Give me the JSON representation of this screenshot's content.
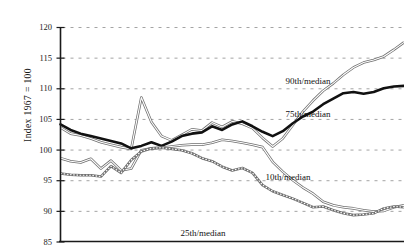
{
  "chart_data": {
    "type": "line",
    "title": "",
    "subtitle": "",
    "xlabel": "",
    "ylabel": "Index 1967 = 100",
    "ylim": [
      85,
      120
    ],
    "xlim": [
      0,
      34
    ],
    "yticks": [
      85,
      90,
      95,
      100,
      105,
      110,
      115,
      120
    ],
    "ytick_labels": [
      "85",
      "90",
      "95",
      "100",
      "105",
      "110",
      "115",
      "120"
    ],
    "xticks": [],
    "xtick_labels": [],
    "grid": "horizontal-dashed",
    "legend_position": "inline-annotations",
    "series": [
      {
        "name": "90th/median",
        "style": "double-thin-gray",
        "label_x": 308,
        "label_y": 77,
        "x": [
          0,
          1,
          2,
          3,
          4,
          5,
          6,
          7,
          8,
          9,
          10,
          11,
          12,
          13,
          14,
          15,
          16,
          17,
          18,
          19,
          20,
          21,
          22,
          23,
          24,
          25,
          26,
          27,
          28,
          29,
          30,
          31,
          32,
          33,
          34
        ],
        "values": [
          103.6,
          102.6,
          102.3,
          101.8,
          101.2,
          100.8,
          100.4,
          100.1,
          108.5,
          104.5,
          102.2,
          101.5,
          102.4,
          103.3,
          103.1,
          104.4,
          103.7,
          104.6,
          104.2,
          103.5,
          101.9,
          100.5,
          101.8,
          104.0,
          106.2,
          108.0,
          109.6,
          110.8,
          112.2,
          113.4,
          114.2,
          114.6,
          115.2,
          116.3,
          117.5
        ]
      },
      {
        "name": "75th/median",
        "style": "thick-black",
        "label_x": 308,
        "label_y": 110,
        "x": [
          0,
          1,
          2,
          3,
          4,
          5,
          6,
          7,
          8,
          9,
          10,
          11,
          12,
          13,
          14,
          15,
          16,
          17,
          18,
          19,
          20,
          21,
          22,
          23,
          24,
          25,
          26,
          27,
          28,
          29,
          30,
          31,
          32,
          33,
          34
        ],
        "values": [
          104.1,
          103.2,
          102.6,
          102.2,
          101.8,
          101.4,
          101.0,
          100.2,
          100.6,
          101.2,
          100.6,
          101.3,
          102.2,
          102.6,
          102.8,
          103.8,
          103.2,
          104.1,
          104.6,
          103.8,
          102.9,
          102.2,
          103.0,
          104.3,
          105.4,
          106.2,
          107.4,
          108.3,
          109.2,
          109.4,
          109.1,
          109.4,
          110.0,
          110.3,
          110.4
        ]
      },
      {
        "name": "10th/median",
        "style": "double-thin-gray",
        "label_x": 288,
        "label_y": 173,
        "x": [
          0,
          1,
          2,
          3,
          4,
          5,
          6,
          7,
          8,
          9,
          10,
          11,
          12,
          13,
          14,
          15,
          16,
          17,
          18,
          19,
          20,
          21,
          22,
          23,
          24,
          25,
          26,
          27,
          28,
          29,
          30,
          31,
          32,
          33,
          34
        ],
        "values": [
          98.6,
          98.1,
          97.9,
          98.5,
          96.9,
          98.2,
          96.6,
          96.9,
          99.9,
          100.2,
          100.3,
          100.5,
          100.7,
          100.8,
          100.8,
          101.1,
          101.6,
          101.4,
          101.1,
          100.8,
          100.4,
          98.0,
          96.4,
          95.0,
          93.8,
          92.8,
          91.5,
          90.9,
          90.6,
          90.4,
          90.1,
          89.9,
          90.0,
          90.6,
          90.9
        ]
      },
      {
        "name": "25th/median",
        "style": "dotted-gray",
        "label_x": 203,
        "label_y": 229,
        "x": [
          0,
          1,
          2,
          3,
          4,
          5,
          6,
          7,
          8,
          9,
          10,
          11,
          12,
          13,
          14,
          15,
          16,
          17,
          18,
          19,
          20,
          21,
          22,
          23,
          24,
          25,
          26,
          27,
          28,
          29,
          30,
          31,
          32,
          33,
          34
        ],
        "values": [
          96.1,
          95.9,
          95.8,
          95.8,
          95.6,
          97.3,
          96.2,
          98.3,
          99.7,
          100.2,
          100.3,
          100.1,
          99.9,
          99.4,
          98.6,
          98.1,
          97.2,
          96.6,
          97.0,
          96.2,
          94.2,
          93.2,
          92.6,
          92.0,
          91.3,
          90.6,
          90.7,
          90.1,
          89.6,
          89.3,
          89.4,
          89.6,
          90.4,
          90.7,
          90.6
        ]
      }
    ]
  },
  "axis": {
    "y_title": "Index 1967 = 100"
  },
  "colors": {
    "line_black": "#111111",
    "line_gray": "#6f6f6f",
    "grid": "#9a9a9a",
    "axis": "#1a1a1a",
    "background": "#ffffff"
  }
}
